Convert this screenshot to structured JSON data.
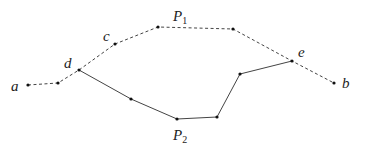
{
  "diagram": {
    "colors": {
      "line": "#444444",
      "point": "#111111",
      "text": "#222222",
      "background": "#ffffff"
    },
    "points": {
      "a": [
        28,
        85
      ],
      "q1": [
        58,
        83
      ],
      "d": [
        79,
        70
      ],
      "c": [
        115,
        44
      ],
      "t1": [
        158,
        27
      ],
      "t2": [
        233,
        29
      ],
      "e": [
        292,
        61
      ],
      "b": [
        334,
        83
      ],
      "s1": [
        131,
        99
      ],
      "s2": [
        177,
        119
      ],
      "s3": [
        217,
        117
      ],
      "s4": [
        240,
        74
      ]
    },
    "paths": [
      {
        "name": "P1",
        "style": "dashed",
        "points": [
          "a",
          "q1",
          "d",
          "c",
          "t1",
          "t2",
          "e",
          "b"
        ]
      },
      {
        "name": "P2",
        "style": "solid",
        "points": [
          "d",
          "s1",
          "s2",
          "s3",
          "s4",
          "e"
        ]
      }
    ],
    "labels": {
      "a": "a",
      "b": "b",
      "c": "c",
      "d": "d",
      "e": "e",
      "p1_main": "P",
      "p1_sub": "1",
      "p2_main": "P",
      "p2_sub": "2"
    }
  }
}
